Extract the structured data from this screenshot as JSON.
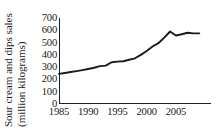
{
  "chart_data": {
    "type": "line",
    "title": "",
    "xlabel": "",
    "ylabel": "Sour cream and dips sales (million kilograms)",
    "ylabel_line1": "Sour cream and dips sales",
    "ylabel_line2": "(million kilograms)",
    "ylim": [
      0,
      700
    ],
    "xlim": [
      1985,
      2011
    ],
    "grid": false,
    "legend": false,
    "legend_position": "none",
    "y_ticks": [
      0,
      100,
      200,
      300,
      400,
      500,
      600,
      700
    ],
    "y_tick_labels": [
      "0",
      "100",
      "200",
      "300",
      "400",
      "500",
      "600",
      "700"
    ],
    "x_ticks": [
      1985,
      1990,
      1995,
      2000,
      2005
    ],
    "x_tick_labels": [
      "1985",
      "1990",
      "1995",
      "2000",
      "2005"
    ],
    "line_color": "#1a1a1a",
    "axis_color": "#1d1d1d",
    "x": [
      1985,
      1986,
      1987,
      1988,
      1989,
      1990,
      1991,
      1992,
      1993,
      1994,
      1995,
      1996,
      1997,
      1998,
      1999,
      2000,
      2001,
      2002,
      2003,
      2004,
      2005,
      2006,
      2007,
      2008,
      2009
    ],
    "values": [
      245,
      252,
      260,
      268,
      276,
      285,
      295,
      308,
      312,
      340,
      345,
      348,
      360,
      372,
      400,
      432,
      468,
      495,
      540,
      590,
      558,
      568,
      580,
      575,
      575
    ],
    "series": [
      {
        "name": "Sour cream and dips sales",
        "values": [
          245,
          252,
          260,
          268,
          276,
          285,
          295,
          308,
          312,
          340,
          345,
          348,
          360,
          372,
          400,
          432,
          468,
          495,
          540,
          590,
          558,
          568,
          580,
          575,
          575
        ]
      }
    ]
  }
}
